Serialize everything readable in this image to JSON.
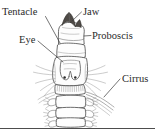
{
  "figure": {
    "kind": "anatomical-line-drawing",
    "background_color": "#ffffff",
    "ink_color": "#4a4a4a",
    "label_color": "#2a2a2a",
    "jaw_color": "#4e4a46"
  },
  "labels": [
    {
      "id": "tentacle",
      "text": "Tentacle",
      "x": 2,
      "y": 15,
      "anchor": "start",
      "leader": "M 45.5,16.5 L 60,43"
    },
    {
      "id": "jaw",
      "text": "Jaw",
      "x": 83,
      "y": 15,
      "anchor": "start",
      "leader": "M 81.5,12 L 72,21"
    },
    {
      "id": "proboscis",
      "text": "Proboscis",
      "x": 92,
      "y": 39,
      "anchor": "start",
      "leader": "M 91,35.5 L 84,36"
    },
    {
      "id": "eye",
      "text": "Eye",
      "x": 19,
      "y": 43,
      "anchor": "start",
      "leader": "M 38,41 L 63,62"
    },
    {
      "id": "cirrus",
      "text": "Cirrus",
      "x": 122,
      "y": 82,
      "anchor": "start",
      "leader": "M 120,79 L 104,97"
    }
  ],
  "rule": {
    "id": "bottom-rule",
    "x1": 0,
    "y1": 128.5,
    "x2": 155,
    "y2": 128.5,
    "color": "#4d4d4d"
  }
}
